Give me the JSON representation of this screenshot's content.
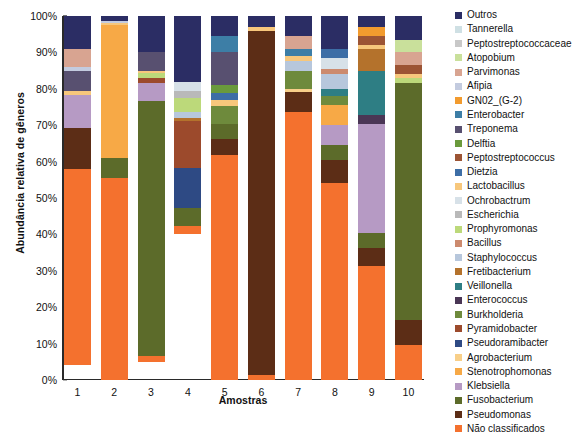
{
  "chart_data": {
    "type": "bar",
    "subtype": "stacked-percent",
    "title": "",
    "xlabel": "Amostras",
    "ylabel": "Abundância relativa de gêneros",
    "categories": [
      "1",
      "2",
      "3",
      "4",
      "5",
      "6",
      "7",
      "8",
      "9",
      "10"
    ],
    "ylim": [
      0,
      100
    ],
    "ytick_labels": [
      "0%",
      "10%",
      "20%",
      "30%",
      "40%",
      "50%",
      "60%",
      "70%",
      "80%",
      "90%",
      "100%"
    ],
    "ytick_values": [
      0,
      10,
      20,
      30,
      40,
      50,
      60,
      70,
      80,
      90,
      100
    ],
    "grid": false,
    "legend_position": "right",
    "legend_order_top_to_bottom": [
      "Outros",
      "Tannerella",
      "Peptostreptococcaceae",
      "Atopobium",
      "Parvimonas",
      "Afipia",
      "GN02_(G-2)",
      "Enterobacter",
      "Treponema",
      "Delftia",
      "Peptostreptococcus",
      "Dietzia",
      "Lactobacillus",
      "Ochrobactrum",
      "Escherichia",
      "Prophyromonas",
      "Bacillus",
      "Staphylococcus",
      "Fretibacterium",
      "Veillonella",
      "Enterococcus",
      "Burkholderia",
      "Pyramidobacter",
      "Pseudoramibacter",
      "Agrobacterium",
      "Stenotrophomonas",
      "Klebsiella",
      "Fusobacterium",
      "Pseudomonas",
      "Não classificados"
    ],
    "colors": {
      "Outros": "#2b2d64",
      "Tannerella": "#cfe0e4",
      "Peptostreptococcaceae": "#c8c8c8",
      "Atopobium": "#c9e09b",
      "Parvimonas": "#d8a491",
      "Afipia": "#c3cbdf",
      "GN02_(G-2)": "#f29b2e",
      "Enterobacter": "#3d7ea6",
      "Treponema": "#585070",
      "Delftia": "#6a9a3c",
      "Peptostreptococcus": "#9c5434",
      "Dietzia": "#3d6ea6",
      "Lactobacillus": "#f7c77c",
      "Ochrobactrum": "#d7e1e8",
      "Escherichia": "#b9b9b9",
      "Prophyromonas": "#bcd97a",
      "Bacillus": "#cc8a6e",
      "Staphylococcus": "#b7c7dc",
      "Fretibacterium": "#b4722c",
      "Veillonella": "#2e7e84",
      "Enterococcus": "#4a3655",
      "Burkholderia": "#6e8a3c",
      "Pyramidobacter": "#9c4a2c",
      "Pseudoramibacter": "#2e4a84",
      "Agrobacterium": "#f8cf89",
      "Stenotrophomonas": "#f7a946",
      "Klebsiella": "#b69ac4",
      "Fusobacterium": "#5c6b2a",
      "Pseudomonas": "#5c2d16",
      "Não classificados": "#f4712e"
    },
    "series": [
      {
        "name": "Outros",
        "values": [
          9.0,
          1.3,
          10.0,
          18.0,
          5.5,
          3.0,
          5.5,
          9.0,
          3.0,
          6.5
        ]
      },
      {
        "name": "Tannerella",
        "values": [
          0.0,
          0.0,
          0.0,
          0.0,
          0.0,
          0.0,
          0.0,
          0.0,
          0.0,
          0.0
        ]
      },
      {
        "name": "Peptostreptococcaceae",
        "values": [
          0.0,
          0.0,
          0.0,
          0.0,
          0.0,
          0.0,
          0.0,
          0.0,
          0.0,
          0.0
        ]
      },
      {
        "name": "Atopobium",
        "values": [
          0.0,
          0.0,
          0.0,
          0.0,
          0.0,
          0.0,
          0.0,
          0.0,
          0.0,
          3.5
        ]
      },
      {
        "name": "Parvimonas",
        "values": [
          5.0,
          0.0,
          0.0,
          0.0,
          0.0,
          0.0,
          3.5,
          0.0,
          0.0,
          3.5
        ]
      },
      {
        "name": "Afipia",
        "values": [
          1.2,
          0.6,
          0.0,
          0.0,
          0.0,
          0.0,
          0.0,
          0.0,
          0.0,
          0.0
        ]
      },
      {
        "name": "GN02_(G-2)",
        "values": [
          0.0,
          0.0,
          0.0,
          0.0,
          0.0,
          0.0,
          0.0,
          0.0,
          2.5,
          0.0
        ]
      },
      {
        "name": "Enterobacter",
        "values": [
          0.0,
          0.0,
          0.0,
          0.0,
          4.5,
          0.0,
          2.0,
          0.0,
          0.0,
          0.0
        ]
      },
      {
        "name": "Treponema",
        "values": [
          5.5,
          0.0,
          5.0,
          0.0,
          9.0,
          0.0,
          0.0,
          0.0,
          0.0,
          0.0
        ]
      },
      {
        "name": "Delftia",
        "values": [
          0.0,
          0.0,
          0.0,
          0.0,
          2.2,
          0.0,
          0.0,
          0.0,
          0.0,
          0.0
        ]
      },
      {
        "name": "Peptostreptococcus",
        "values": [
          0.0,
          0.0,
          0.0,
          0.0,
          0.0,
          0.0,
          0.0,
          0.0,
          2.5,
          2.5
        ]
      },
      {
        "name": "Dietzia",
        "values": [
          0.0,
          0.0,
          0.0,
          0.0,
          2.0,
          0.0,
          0.0,
          2.5,
          0.0,
          0.0
        ]
      },
      {
        "name": "Lactobacillus",
        "values": [
          1.0,
          0.5,
          0.8,
          0.0,
          1.5,
          1.2,
          1.5,
          0.0,
          1.2,
          1.0
        ]
      },
      {
        "name": "Ochrobactrum",
        "values": [
          0.0,
          0.0,
          0.0,
          2.5,
          0.0,
          0.0,
          0.0,
          3.0,
          0.0,
          0.0
        ]
      },
      {
        "name": "Escherichia",
        "values": [
          0.0,
          0.0,
          0.0,
          2.0,
          0.0,
          0.0,
          0.0,
          0.0,
          0.0,
          0.0
        ]
      },
      {
        "name": "Prophyromonas",
        "values": [
          0.0,
          0.0,
          1.2,
          4.0,
          0.0,
          0.0,
          0.0,
          0.0,
          0.0,
          1.5
        ]
      },
      {
        "name": "Bacillus",
        "values": [
          0.0,
          0.0,
          0.0,
          0.0,
          0.0,
          0.0,
          0.0,
          1.5,
          0.0,
          0.0
        ]
      },
      {
        "name": "Staphylococcus",
        "values": [
          0.0,
          0.0,
          0.0,
          1.5,
          0.0,
          0.0,
          2.5,
          4.0,
          0.0,
          0.0
        ]
      },
      {
        "name": "Fretibacterium",
        "values": [
          0.0,
          0.0,
          0.0,
          0.8,
          0.0,
          0.0,
          0.0,
          0.0,
          6.0,
          0.0
        ]
      },
      {
        "name": "Veillonella",
        "values": [
          0.0,
          0.0,
          0.0,
          0.0,
          0.0,
          0.0,
          0.0,
          2.0,
          12.0,
          0.0
        ]
      },
      {
        "name": "Enterococcus",
        "values": [
          0.0,
          0.0,
          0.0,
          0.0,
          0.0,
          0.0,
          0.0,
          0.0,
          2.5,
          0.0
        ]
      },
      {
        "name": "Burkholderia",
        "values": [
          0.0,
          0.0,
          0.0,
          0.0,
          5.0,
          0.0,
          5.0,
          2.5,
          0.0,
          0.0
        ]
      },
      {
        "name": "Pyramidobacter",
        "values": [
          0.0,
          0.0,
          1.5,
          13.0,
          0.0,
          0.0,
          0.0,
          0.0,
          0.0,
          0.0
        ]
      },
      {
        "name": "Pseudoramibacter",
        "values": [
          0.0,
          0.0,
          0.0,
          11.0,
          0.0,
          0.0,
          0.0,
          0.0,
          0.0,
          0.0
        ]
      },
      {
        "name": "Agrobacterium",
        "values": [
          0.0,
          0.0,
          0.0,
          0.0,
          0.0,
          0.0,
          1.0,
          0.0,
          0.0,
          0.0
        ]
      },
      {
        "name": "Stenotrophomonas",
        "values": [
          0.0,
          36.5,
          0.0,
          0.0,
          0.0,
          0.0,
          0.0,
          5.5,
          0.0,
          0.0
        ]
      },
      {
        "name": "Klebsiella",
        "values": [
          9.0,
          0.0,
          5.0,
          0.0,
          0.0,
          0.0,
          0.0,
          5.5,
          30.0,
          0.0
        ]
      },
      {
        "name": "Fusobacterium",
        "values": [
          0.0,
          5.5,
          70.0,
          5.0,
          4.0,
          0.0,
          0.0,
          4.0,
          4.0,
          65.0
        ]
      },
      {
        "name": "Pseudomonas",
        "values": [
          11.3,
          0.0,
          0.0,
          0.0,
          4.5,
          94.3,
          5.5,
          6.5,
          5.0,
          7.0
        ]
      },
      {
        "name": "Não classificados",
        "values": [
          54.0,
          55.6,
          1.5,
          2.2,
          61.8,
          1.5,
          73.5,
          54.0,
          31.3,
          9.5
        ]
      }
    ]
  },
  "axis": {
    "x_title": "Amostras",
    "y_title": "Abundância relativa de gêneros"
  },
  "legend": {
    "items": [
      {
        "label": "Outros",
        "color": "#2b2d64"
      },
      {
        "label": "Tannerella",
        "color": "#cfe0e4"
      },
      {
        "label": "Peptostreptococcaceae",
        "color": "#c8c8c8"
      },
      {
        "label": "Atopobium",
        "color": "#c9e09b"
      },
      {
        "label": "Parvimonas",
        "color": "#d8a491"
      },
      {
        "label": "Afipia",
        "color": "#c3cbdf"
      },
      {
        "label": "GN02_(G-2)",
        "color": "#f29b2e"
      },
      {
        "label": "Enterobacter",
        "color": "#3d7ea6"
      },
      {
        "label": "Treponema",
        "color": "#585070"
      },
      {
        "label": "Delftia",
        "color": "#6a9a3c"
      },
      {
        "label": "Peptostreptococcus",
        "color": "#9c5434"
      },
      {
        "label": "Dietzia",
        "color": "#3d6ea6"
      },
      {
        "label": "Lactobacillus",
        "color": "#f7c77c"
      },
      {
        "label": "Ochrobactrum",
        "color": "#d7e1e8"
      },
      {
        "label": "Escherichia",
        "color": "#b9b9b9"
      },
      {
        "label": "Prophyromonas",
        "color": "#bcd97a"
      },
      {
        "label": "Bacillus",
        "color": "#cc8a6e"
      },
      {
        "label": "Staphylococcus",
        "color": "#b7c7dc"
      },
      {
        "label": "Fretibacterium",
        "color": "#b4722c"
      },
      {
        "label": "Veillonella",
        "color": "#2e7e84"
      },
      {
        "label": "Enterococcus",
        "color": "#4a3655"
      },
      {
        "label": "Burkholderia",
        "color": "#6e8a3c"
      },
      {
        "label": "Pyramidobacter",
        "color": "#9c4a2c"
      },
      {
        "label": "Pseudoramibacter",
        "color": "#2e4a84"
      },
      {
        "label": "Agrobacterium",
        "color": "#f8cf89"
      },
      {
        "label": "Stenotrophomonas",
        "color": "#f7a946"
      },
      {
        "label": "Klebsiella",
        "color": "#b69ac4"
      },
      {
        "label": "Fusobacterium",
        "color": "#5c6b2a"
      },
      {
        "label": "Pseudomonas",
        "color": "#5c2d16"
      },
      {
        "label": "Não classificados",
        "color": "#f4712e"
      }
    ]
  }
}
